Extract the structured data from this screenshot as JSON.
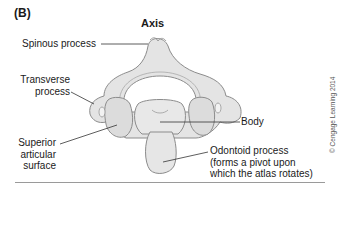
{
  "figure": {
    "panel_label": "(B)",
    "title": "Axis",
    "labels": {
      "spinous_process": "Spinous process",
      "transverse_process_line1": "Transverse",
      "transverse_process_line2": "process",
      "superior_articular_line1": "Superior",
      "superior_articular_line2": "articular",
      "superior_articular_line3": "surface",
      "body": "Body",
      "odontoid_line1": "Odontoid process",
      "odontoid_line2": "(forms a pivot upon",
      "odontoid_line3": "which the atlas rotates)"
    },
    "credit": "© Cengage Learning 2014",
    "colors": {
      "bone_fill": "#e6e6e6",
      "bone_shade": "#cfcfcf",
      "outline": "#8c8c8c",
      "leader": "#333333",
      "rule": "#9a9a9a"
    }
  }
}
